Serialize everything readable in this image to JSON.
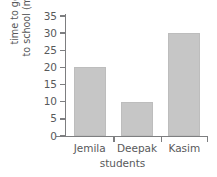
{
  "chart_data": {
    "type": "bar",
    "title": "",
    "subtitle": "",
    "xlabel": "students",
    "ylabel_line1": "time to get",
    "ylabel_line2": "to school (mins)",
    "ylabel": "time to get to school (mins)",
    "categories": [
      "Jemila",
      "Deepak",
      "Kasim"
    ],
    "values": [
      20,
      10,
      30
    ],
    "series": [
      {
        "name": "time to get to school (mins)",
        "values": [
          20,
          10,
          30
        ]
      }
    ],
    "ylim": [
      0,
      35
    ],
    "ytick_labels": [
      "0",
      "5",
      "10",
      "15",
      "20",
      "25",
      "30",
      "35"
    ],
    "ytick_values": [
      0,
      5,
      10,
      15,
      20,
      25,
      30,
      35
    ],
    "grid": false,
    "legend": "none",
    "bar_color": "#c6c6c6",
    "bar_border_color": "#bdbdbd",
    "axis_color": "#7d7e80",
    "text_color": "#58595b",
    "background_color": "#ffffff"
  }
}
